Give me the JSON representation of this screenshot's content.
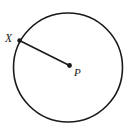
{
  "figure": {
    "kind": "circle-with-radius-diagram",
    "background_color": "#ffffff",
    "stroke_color": "#1a1a1a",
    "width": 133,
    "height": 135,
    "circle": {
      "name": "circle-outline",
      "center_x": 68,
      "center_y": 67.5,
      "radius": 54.5,
      "stroke_width": 1.6
    },
    "radius_segment": {
      "name": "radius-segment",
      "x1": 19.5,
      "y1": 40.5,
      "x2": 69.5,
      "y2": 65.5,
      "stroke_width": 1.6
    },
    "points": [
      {
        "id": "X",
        "label": "X",
        "cx": 19.5,
        "cy": 40.5,
        "dot_radius": 2.2,
        "label_x": 5,
        "label_y": 42,
        "on_circle": true
      },
      {
        "id": "P",
        "label": "P",
        "cx": 69.5,
        "cy": 65.5,
        "dot_radius": 2.4,
        "label_x": 74,
        "label_y": 76,
        "on_circle": false
      }
    ]
  }
}
